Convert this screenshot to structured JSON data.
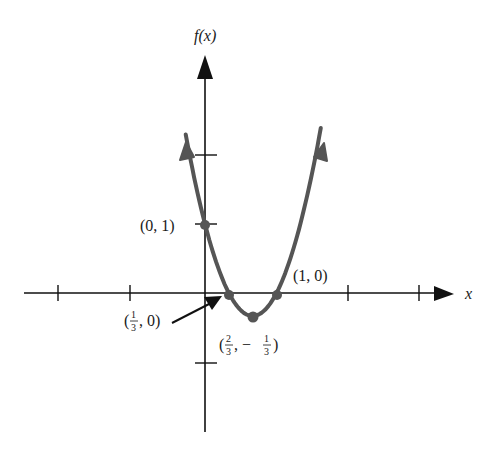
{
  "chart_data": {
    "type": "line",
    "title": "",
    "function": "f(x) = 3x^2 - 4x + 1",
    "xlabel": "x",
    "ylabel": "f(x)",
    "x_ticks": [
      -2,
      -1,
      1,
      2,
      3
    ],
    "y_ticks": [
      -1,
      1,
      2
    ],
    "xlim": [
      -2.6,
      3.5
    ],
    "ylim": [
      -2.0,
      3.4
    ],
    "grid": false,
    "series": [
      {
        "name": "f(x)",
        "color": "#555555",
        "x_range": [
          -0.27,
          1.62
        ],
        "points": [
          {
            "x": 0,
            "y": 1
          },
          {
            "x": 0.3333,
            "y": 0
          },
          {
            "x": 0.6667,
            "y": -0.3333
          },
          {
            "x": 1,
            "y": 0
          }
        ]
      }
    ],
    "annotations": [
      {
        "text": "(0, 1)",
        "x": 0,
        "y": 1
      },
      {
        "text": "(1/3, 0)",
        "x": 0.3333,
        "y": 0,
        "arrow": true
      },
      {
        "text": "(2/3, -1/3)",
        "x": 0.6667,
        "y": -0.3333
      },
      {
        "text": "(1, 0)",
        "x": 1,
        "y": 0
      }
    ]
  },
  "labels": {
    "y_axis": "f(x)",
    "x_axis": "x",
    "pt_0_1": "(0, 1)",
    "pt_1_0": "(1, 0)",
    "pt_third_open": "(",
    "pt_third_num": "1",
    "pt_third_den": "3",
    "pt_third_rest": ", 0)",
    "pt_vertex_open": "(",
    "pt_vertex_num": "2",
    "pt_vertex_den": "3",
    "pt_vertex_mid": ", −",
    "pt_vertex_num2": "1",
    "pt_vertex_den2": "3",
    "pt_vertex_close": ")"
  }
}
